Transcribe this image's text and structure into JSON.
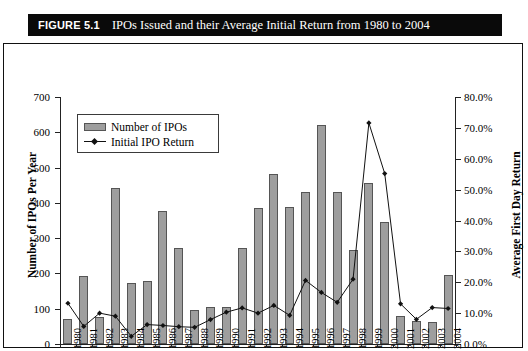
{
  "figure": {
    "label": "FIGURE 5.1",
    "title": "IPOs Issued and their Average Initial Return from 1980 to 2004"
  },
  "legend": {
    "position": "top-left-inside",
    "items": [
      {
        "label": "Number of IPOs",
        "marker": "bar-swatch",
        "color": "#9e9e9e"
      },
      {
        "label": "Initial IPO Return",
        "marker": "line-diamond",
        "color": "#111111"
      }
    ]
  },
  "axes": {
    "left_title": "Number of IPOs Per Year",
    "right_title": "Average First Day Return",
    "left_ticks": [
      "0",
      "100",
      "200",
      "300",
      "400",
      "500",
      "600",
      "700"
    ],
    "right_ticks": [
      "0.0%",
      "10.0%",
      "20.0%",
      "30.0%",
      "40.0%",
      "50.0%",
      "60.0%",
      "70.0%",
      "80.0%"
    ]
  },
  "chart_data": {
    "type": "bar",
    "title": "IPOs Issued and their Average Initial Return from 1980 to 2004",
    "xlabel": "",
    "ylabel": "Number of IPOs Per Year",
    "y2label": "Average First Day Return",
    "ylim": [
      0,
      700
    ],
    "y2lim": [
      0,
      80
    ],
    "grid": false,
    "legend_position": "upper left",
    "categories": [
      "1980",
      "1981",
      "1982",
      "1983",
      "1984",
      "1985",
      "1986",
      "1987",
      "1988",
      "1989",
      "1990",
      "1991",
      "1992",
      "1993",
      "1994",
      "1995",
      "1996",
      "1997",
      "1998",
      "1999",
      "2000",
      "2001",
      "2002",
      "2003",
      "2004"
    ],
    "series": [
      {
        "name": "Number of IPOs",
        "type": "bar",
        "axis": "left",
        "unit": "IPOs",
        "color": "#9e9e9e",
        "values": [
          71,
          192,
          77,
          442,
          172,
          179,
          378,
          271,
          97,
          105,
          104,
          273,
          385,
          483,
          387,
          432,
          621,
          432,
          267,
          457,
          346,
          80,
          66,
          63,
          195
        ]
      },
      {
        "name": "Initial IPO Return",
        "type": "line",
        "axis": "right",
        "unit": "%",
        "color": "#111111",
        "values": [
          13.2,
          5.7,
          10.0,
          9.0,
          2.5,
          6.3,
          6.0,
          5.6,
          5.4,
          7.9,
          10.3,
          11.7,
          10.0,
          12.5,
          9.3,
          20.6,
          16.7,
          13.5,
          21.0,
          71.6,
          55.2,
          13.0,
          8.0,
          11.8,
          11.5
        ]
      }
    ]
  }
}
